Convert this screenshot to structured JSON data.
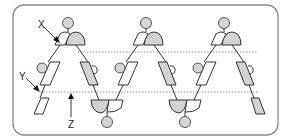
{
  "diagram": {
    "type": "alternating strand diagram",
    "frame": {
      "x": 13,
      "y": 5,
      "width": 265,
      "height": 130,
      "radius": 11
    },
    "colors": {
      "gray_fill": "#d3d3d3",
      "circle_fill": "#d6d6d6",
      "line": "#333333",
      "frame": "#8a8a8a"
    },
    "reference_lines": [
      {
        "name": "upper-dotted-line",
        "y": 52,
        "x1": 78,
        "x2": 258
      },
      {
        "name": "lower-dotted-line",
        "y": 92,
        "x1": 40,
        "x2": 258
      }
    ],
    "peaks": [
      {
        "x": 68
      },
      {
        "x": 146
      },
      {
        "x": 224
      }
    ],
    "troughs": [
      {
        "x": 107
      },
      {
        "x": 185
      }
    ],
    "labels": {
      "x": {
        "text": "X",
        "tx": 38,
        "ty": 27
      },
      "y": {
        "text": "Y",
        "tx": 19,
        "ty": 79
      },
      "z": {
        "text": "Z",
        "tx": 68,
        "ty": 127
      }
    }
  }
}
